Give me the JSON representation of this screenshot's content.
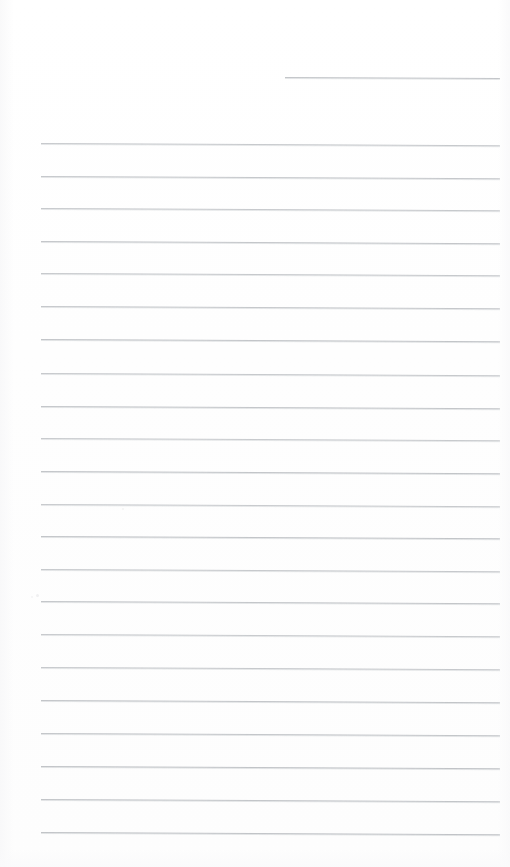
{
  "document": {
    "type": "scanned-ruled-paper",
    "title": "",
    "page_width": 510,
    "page_height": 867,
    "background_color": "#ffffff",
    "rule_color": "#b9bcc0",
    "content_text": "",
    "handwriting_present": "no",
    "printed_text_present": "no",
    "notes_count": 0
  },
  "ruling": {
    "line_count": 23,
    "full_line_count": 22,
    "partial_line_count": 1,
    "nominal_spacing_px": 32.8,
    "left_margin_px": 41,
    "right_margin_px": 500,
    "first_line_y_px": 77,
    "last_line_y_px": 832,
    "skew_degrees": 0.28,
    "lines": [
      {
        "index": 1,
        "x": 285,
        "y": 77,
        "width": 215,
        "skew": 0.25,
        "opacity": 0.85,
        "partial": "true"
      },
      {
        "index": 2,
        "x": 41,
        "y": 143,
        "width": 459,
        "skew": 0.28,
        "opacity": 0.8,
        "partial": "false"
      },
      {
        "index": 3,
        "x": 41,
        "y": 176,
        "width": 459,
        "skew": 0.28,
        "opacity": 0.82,
        "partial": "false"
      },
      {
        "index": 4,
        "x": 41,
        "y": 208,
        "width": 459,
        "skew": 0.28,
        "opacity": 0.8,
        "partial": "false"
      },
      {
        "index": 5,
        "x": 41,
        "y": 241,
        "width": 459,
        "skew": 0.28,
        "opacity": 0.84,
        "partial": "false"
      },
      {
        "index": 6,
        "x": 41,
        "y": 273,
        "width": 459,
        "skew": 0.28,
        "opacity": 0.8,
        "partial": "false"
      },
      {
        "index": 7,
        "x": 41,
        "y": 306,
        "width": 459,
        "skew": 0.28,
        "opacity": 0.82,
        "partial": "false"
      },
      {
        "index": 8,
        "x": 41,
        "y": 339,
        "width": 459,
        "skew": 0.28,
        "opacity": 0.86,
        "partial": "false"
      },
      {
        "index": 9,
        "x": 41,
        "y": 373,
        "width": 459,
        "skew": 0.28,
        "opacity": 0.8,
        "partial": "false"
      },
      {
        "index": 10,
        "x": 41,
        "y": 406,
        "width": 459,
        "skew": 0.28,
        "opacity": 0.84,
        "partial": "false"
      },
      {
        "index": 11,
        "x": 41,
        "y": 438,
        "width": 459,
        "skew": 0.28,
        "opacity": 0.78,
        "partial": "false"
      },
      {
        "index": 12,
        "x": 41,
        "y": 471,
        "width": 459,
        "skew": 0.28,
        "opacity": 0.86,
        "partial": "false"
      },
      {
        "index": 13,
        "x": 41,
        "y": 504,
        "width": 459,
        "skew": 0.28,
        "opacity": 0.78,
        "partial": "false"
      },
      {
        "index": 14,
        "x": 41,
        "y": 536,
        "width": 459,
        "skew": 0.28,
        "opacity": 0.86,
        "partial": "false"
      },
      {
        "index": 15,
        "x": 41,
        "y": 569,
        "width": 459,
        "skew": 0.28,
        "opacity": 0.8,
        "partial": "false"
      },
      {
        "index": 16,
        "x": 41,
        "y": 601,
        "width": 459,
        "skew": 0.28,
        "opacity": 0.84,
        "partial": "false"
      },
      {
        "index": 17,
        "x": 41,
        "y": 634,
        "width": 459,
        "skew": 0.28,
        "opacity": 0.78,
        "partial": "false"
      },
      {
        "index": 18,
        "x": 41,
        "y": 667,
        "width": 459,
        "skew": 0.28,
        "opacity": 0.8,
        "partial": "false"
      },
      {
        "index": 19,
        "x": 41,
        "y": 700,
        "width": 459,
        "skew": 0.28,
        "opacity": 0.86,
        "partial": "false"
      },
      {
        "index": 20,
        "x": 41,
        "y": 733,
        "width": 459,
        "skew": 0.28,
        "opacity": 0.84,
        "partial": "false"
      },
      {
        "index": 21,
        "x": 41,
        "y": 766,
        "width": 459,
        "skew": 0.28,
        "opacity": 0.88,
        "partial": "false"
      },
      {
        "index": 22,
        "x": 41,
        "y": 799,
        "width": 459,
        "skew": 0.28,
        "opacity": 0.86,
        "partial": "false"
      },
      {
        "index": 23,
        "x": 41,
        "y": 832,
        "width": 459,
        "skew": 0.28,
        "opacity": 0.88,
        "partial": "false"
      }
    ]
  },
  "artifacts": {
    "specks": [
      {
        "x": 36,
        "y": 594,
        "size": 3,
        "color": "#ededee"
      },
      {
        "x": 122,
        "y": 508,
        "size": 2,
        "color": "#f0f0f1"
      },
      {
        "x": 31,
        "y": 596,
        "size": 2,
        "color": "#f1f1f2"
      }
    ]
  }
}
